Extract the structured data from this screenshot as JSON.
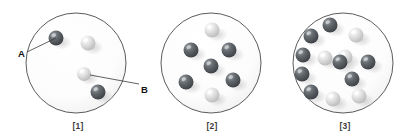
{
  "figure": {
    "title": "",
    "background_color": "#ffffff",
    "width": 403,
    "height": 139,
    "circle_stroke_color": "#4a4a4a",
    "sphere_dark_color": "#555a5f",
    "sphere_light_color": "#d8d8d8"
  },
  "callouts": [
    {
      "id": "A",
      "label": "A",
      "label_x": 18,
      "label_y": 48,
      "line_from_x": 27,
      "line_from_y": 52,
      "line_to_x": 56,
      "line_to_y": 38,
      "target": "dark-sphere"
    },
    {
      "id": "B",
      "label": "B",
      "label_x": 141,
      "label_y": 84,
      "line_from_x": 139,
      "line_from_y": 84,
      "line_to_x": 90,
      "line_to_y": 75,
      "target": "light-sphere"
    }
  ],
  "containers": [
    {
      "caption": "[1]",
      "caption_x": 58,
      "caption_y": 121,
      "center_x": 76,
      "center_y": 63,
      "radius": 50,
      "sphere_count": 4,
      "dark_count": 2,
      "light_count": 2,
      "spheres": [
        {
          "x": 56,
          "y": 38,
          "r": 7.5,
          "type": "dark"
        },
        {
          "x": 88,
          "y": 43,
          "r": 7.5,
          "type": "light"
        },
        {
          "x": 84,
          "y": 74,
          "r": 7.0,
          "type": "light"
        },
        {
          "x": 98,
          "y": 92,
          "r": 7.5,
          "type": "dark"
        }
      ]
    },
    {
      "caption": "[2]",
      "caption_x": 192,
      "caption_y": 121,
      "center_x": 211,
      "center_y": 63,
      "radius": 50,
      "sphere_count": 7,
      "dark_count": 5,
      "light_count": 2,
      "spheres": [
        {
          "x": 212,
          "y": 30,
          "r": 7.5,
          "type": "light"
        },
        {
          "x": 191,
          "y": 50,
          "r": 7.5,
          "type": "dark"
        },
        {
          "x": 229,
          "y": 50,
          "r": 7.5,
          "type": "dark"
        },
        {
          "x": 211,
          "y": 66,
          "r": 7.5,
          "type": "dark"
        },
        {
          "x": 186,
          "y": 82,
          "r": 7.5,
          "type": "dark"
        },
        {
          "x": 233,
          "y": 80,
          "r": 7.5,
          "type": "dark"
        },
        {
          "x": 212,
          "y": 95,
          "r": 7.5,
          "type": "light"
        }
      ]
    },
    {
      "caption": "[3]",
      "caption_x": 325,
      "caption_y": 121,
      "center_x": 343,
      "center_y": 63,
      "radius": 50,
      "sphere_count": 13,
      "dark_count": 8,
      "light_count": 5,
      "spheres": [
        {
          "x": 330,
          "y": 25,
          "r": 7.5,
          "type": "dark"
        },
        {
          "x": 311,
          "y": 36,
          "r": 7.5,
          "type": "dark"
        },
        {
          "x": 356,
          "y": 35,
          "r": 7.5,
          "type": "light"
        },
        {
          "x": 303,
          "y": 55,
          "r": 7.5,
          "type": "dark"
        },
        {
          "x": 325,
          "y": 58,
          "r": 7.5,
          "type": "light"
        },
        {
          "x": 345,
          "y": 57,
          "r": 7.5,
          "type": "light"
        },
        {
          "x": 302,
          "y": 74,
          "r": 7.5,
          "type": "dark"
        },
        {
          "x": 340,
          "y": 62,
          "r": 7.5,
          "type": "dark"
        },
        {
          "x": 368,
          "y": 62,
          "r": 7.5,
          "type": "dark"
        },
        {
          "x": 352,
          "y": 79,
          "r": 7.5,
          "type": "dark"
        },
        {
          "x": 311,
          "y": 92,
          "r": 7.5,
          "type": "dark"
        },
        {
          "x": 333,
          "y": 99,
          "r": 7.5,
          "type": "light"
        },
        {
          "x": 359,
          "y": 96,
          "r": 7.5,
          "type": "light"
        }
      ]
    }
  ]
}
